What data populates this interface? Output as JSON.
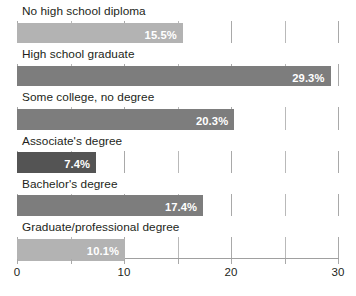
{
  "chart_data": {
    "type": "bar",
    "orientation": "horizontal",
    "title": "",
    "subtitle": "",
    "xlabel": "",
    "ylabel": "",
    "xlim": [
      0,
      30
    ],
    "grid": true,
    "gridlines": [
      0,
      5,
      10,
      15,
      20,
      25,
      30
    ],
    "tick_labels": [
      "0",
      "10",
      "20",
      "30"
    ],
    "tick_label_values": [
      0,
      10,
      20,
      30
    ],
    "legend": null,
    "value_suffix": "%",
    "categories": [
      "No high school diploma",
      "High school graduate",
      "Some college, no degree",
      "Associate's degree",
      "Bachelor's degree",
      "Graduate/professional degree"
    ],
    "values": [
      15.5,
      29.3,
      20.3,
      7.4,
      17.4,
      10.1
    ],
    "value_labels": [
      "15.5%",
      "29.3%",
      "20.3%",
      "7.4%",
      "17.4%",
      "10.1%"
    ],
    "bar_colors": [
      "#b3b3b3",
      "#7d7d7d",
      "#7d7d7d",
      "#545454",
      "#7d7d7d",
      "#b3b3b3"
    ]
  },
  "axis": {
    "grid_color": "#b9b9b9",
    "baseline_color": "#a0a0a0",
    "tick_text_color": "#231f20"
  },
  "styles": {
    "background": "#ffffff",
    "label_color": "#231f20",
    "value_text_color": "#ffffff"
  }
}
